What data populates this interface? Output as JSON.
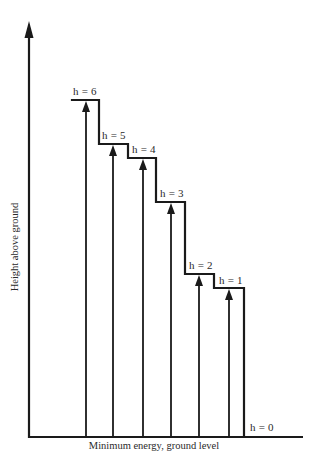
{
  "diagram": {
    "x_axis_label": "Minimum energy, ground level",
    "y_axis_label": "Height above ground",
    "levels": [
      {
        "label": "h = 6",
        "height": 6
      },
      {
        "label": "h = 5",
        "height": 5
      },
      {
        "label": "h = 4",
        "height": 4
      },
      {
        "label": "h = 3",
        "height": 3
      },
      {
        "label": "h = 2",
        "height": 2
      },
      {
        "label": "h = 1",
        "height": 1
      },
      {
        "label": "h = 0",
        "height": 0
      }
    ],
    "colors": {
      "line": "#1a1a1a",
      "text": "#2a2a2a",
      "background": "#ffffff"
    }
  }
}
